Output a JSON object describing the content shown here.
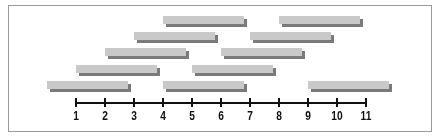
{
  "chart_data": {
    "type": "bar",
    "subtype": "interval-timeline",
    "title": "",
    "xlabel": "",
    "ylabel": "",
    "xlim": [
      1,
      11
    ],
    "ticks": [
      1,
      2,
      3,
      4,
      5,
      6,
      7,
      8,
      9,
      10,
      11
    ],
    "tick_labels": [
      "1",
      "2",
      "3",
      "4",
      "5",
      "6",
      "7",
      "8",
      "9",
      "10",
      "11"
    ],
    "grid": false,
    "legend": null,
    "rows": [
      {
        "row": 1,
        "intervals": [
          [
            4,
            6.8
          ],
          [
            8,
            10.8
          ]
        ]
      },
      {
        "row": 2,
        "intervals": [
          [
            3,
            5.8
          ],
          [
            7,
            9.8
          ]
        ]
      },
      {
        "row": 3,
        "intervals": [
          [
            2,
            4.8
          ],
          [
            6,
            8.8
          ]
        ]
      },
      {
        "row": 4,
        "intervals": [
          [
            1,
            3.8
          ],
          [
            5,
            7.8
          ]
        ]
      },
      {
        "row": 5,
        "intervals": [
          [
            0,
            2.8
          ],
          [
            4,
            6.8
          ],
          [
            9,
            11.8
          ]
        ]
      }
    ],
    "colors": {
      "bar_face": "#c9c9c9",
      "bar_shadow": "#7a7a7a",
      "axis": "#111111",
      "frame": "#9a9a9a"
    }
  },
  "layout": {
    "axis_x0": 76,
    "unit_px": 29,
    "axis_y": 102,
    "row_tops": [
      16,
      32,
      48,
      65,
      81
    ]
  }
}
